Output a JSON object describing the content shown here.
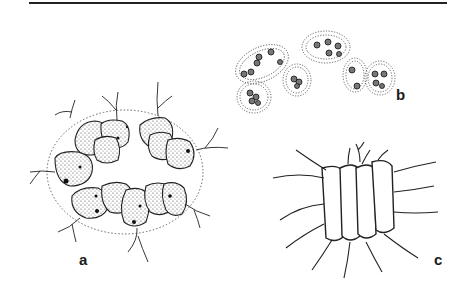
{
  "figure": {
    "panels": [
      {
        "id": "a",
        "label": "a",
        "description": "colony of stippled cells with flagella in a dotted ellipse"
      },
      {
        "id": "b",
        "label": "b",
        "description": "groups of cells in dotted gelatinous envelopes"
      },
      {
        "id": "c",
        "label": "c",
        "description": "chain of four elongated cells with long spines"
      }
    ]
  }
}
